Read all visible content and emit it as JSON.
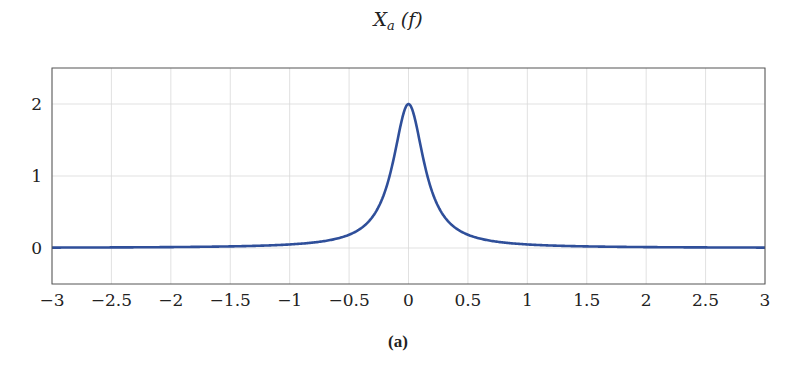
{
  "figure": {
    "title_main": "X",
    "title_sub": "a",
    "title_arg": " (f)",
    "caption": "(a)"
  },
  "chart_data": {
    "type": "line",
    "xlabel": "",
    "ylabel": "",
    "xlim": [
      -3,
      3
    ],
    "ylim": [
      -0.5,
      2.5
    ],
    "xticks": [
      -3,
      -2.5,
      -2,
      -1.5,
      -1,
      -0.5,
      0,
      0.5,
      1,
      1.5,
      2,
      2.5,
      3
    ],
    "xtick_labels": [
      "−3",
      "−2.5",
      "−2",
      "−1.5",
      "−1",
      "−0.5",
      "0",
      "0.5",
      "1",
      "1.5",
      "2",
      "2.5",
      "3"
    ],
    "yticks": [
      0,
      1,
      2
    ],
    "ytick_labels": [
      "0",
      "1",
      "2"
    ],
    "grid": true,
    "legend": null,
    "series": [
      {
        "name": "X_a(f)",
        "formula": "2/(1+(2*pi*f)^2)",
        "color": "#2f4f9a",
        "x": [
          -3,
          -2.5,
          -2,
          -1.5,
          -1,
          -0.75,
          -0.5,
          -0.4,
          -0.3,
          -0.2,
          -0.15,
          -0.1,
          -0.05,
          0,
          0.05,
          0.1,
          0.15,
          0.2,
          0.3,
          0.4,
          0.5,
          0.75,
          1,
          1.5,
          2,
          2.5,
          3
        ],
        "values": [
          0.0056,
          0.0081,
          0.0127,
          0.0225,
          0.0494,
          0.0864,
          0.1841,
          0.2732,
          0.4396,
          0.7765,
          1.0593,
          1.3433,
          1.8206,
          2.0,
          1.8206,
          1.3433,
          1.0593,
          0.7765,
          0.4396,
          0.2732,
          0.1841,
          0.0864,
          0.0494,
          0.0225,
          0.0127,
          0.0081,
          0.0056
        ]
      }
    ]
  }
}
